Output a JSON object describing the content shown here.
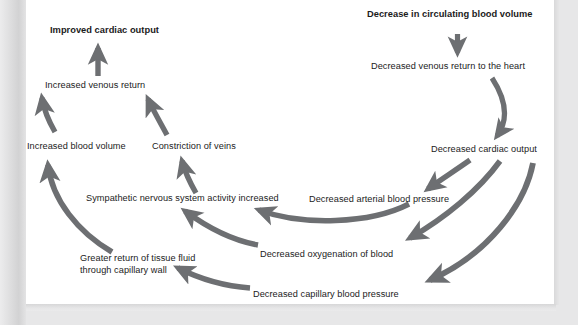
{
  "figure": {
    "kind": "flow-diagram",
    "arrow_color": "#6d6f72",
    "text_color": "#1b1b1b",
    "page_color": "#ffffff",
    "background_color": "#e7e7e8"
  },
  "nodes": [
    {
      "id": "decrease-circulating-blood-volume",
      "label": "Decrease in circulating blood volume",
      "emphasis": "bold"
    },
    {
      "id": "decreased-venous-return-to-heart",
      "label": "Decreased venous return to the heart",
      "emphasis": "normal"
    },
    {
      "id": "decreased-cardiac-output",
      "label": "Decreased cardiac output",
      "emphasis": "normal"
    },
    {
      "id": "decreased-arterial-blood-pressure",
      "label": "Decreased arterial blood pressure",
      "emphasis": "normal"
    },
    {
      "id": "decreased-oxygenation-of-blood",
      "label": "Decreased oxygenation of blood",
      "emphasis": "normal"
    },
    {
      "id": "decreased-capillary-blood-pressure",
      "label": "Decreased capillary blood pressure",
      "emphasis": "normal"
    },
    {
      "id": "sympathetic-nervous-system-activity-increased",
      "label": "Sympathetic nervous system activity increased",
      "emphasis": "normal"
    },
    {
      "id": "greater-return-of-tissue-fluid",
      "label_line1": "Greater return of tissue fluid",
      "label_line2": "through capillary wall",
      "emphasis": "normal"
    },
    {
      "id": "increased-blood-volume",
      "label": "Increased blood volume",
      "emphasis": "normal"
    },
    {
      "id": "constriction-of-veins",
      "label": "Constriction of veins",
      "emphasis": "normal"
    },
    {
      "id": "increased-venous-return",
      "label": "Increased venous return",
      "emphasis": "normal"
    },
    {
      "id": "improved-cardiac-output",
      "label": "Improved cardiac output",
      "emphasis": "bold"
    }
  ],
  "edges": [
    {
      "from": "decrease-circulating-blood-volume",
      "to": "decreased-venous-return-to-heart",
      "shape": "straight-down"
    },
    {
      "from": "decreased-venous-return-to-heart",
      "to": "decreased-cardiac-output",
      "shape": "curve-down"
    },
    {
      "from": "decreased-cardiac-output",
      "to": "decreased-arterial-blood-pressure",
      "shape": "curve-down-left"
    },
    {
      "from": "decreased-cardiac-output",
      "to": "decreased-oxygenation-of-blood",
      "shape": "curve-down-left"
    },
    {
      "from": "decreased-cardiac-output",
      "to": "decreased-capillary-blood-pressure",
      "shape": "curve-down-left"
    },
    {
      "from": "decreased-arterial-blood-pressure",
      "to": "sympathetic-nervous-system-activity-increased",
      "shape": "curve-left"
    },
    {
      "from": "decreased-oxygenation-of-blood",
      "to": "sympathetic-nervous-system-activity-increased",
      "shape": "curve-up-left"
    },
    {
      "from": "decreased-capillary-blood-pressure",
      "to": "greater-return-of-tissue-fluid",
      "shape": "curve-up-left"
    },
    {
      "from": "greater-return-of-tissue-fluid",
      "to": "increased-blood-volume",
      "shape": "curve-up-left"
    },
    {
      "from": "sympathetic-nervous-system-activity-increased",
      "to": "constriction-of-veins",
      "shape": "curve-up"
    },
    {
      "from": "increased-blood-volume",
      "to": "increased-venous-return",
      "shape": "curve-up"
    },
    {
      "from": "constriction-of-veins",
      "to": "increased-venous-return",
      "shape": "curve-up-left"
    },
    {
      "from": "increased-venous-return",
      "to": "improved-cardiac-output",
      "shape": "straight-up"
    }
  ]
}
